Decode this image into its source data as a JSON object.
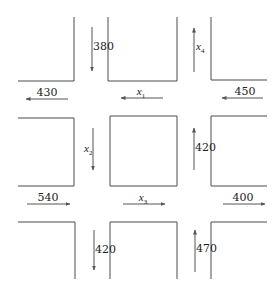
{
  "diagram": {
    "line_color": "#4a4a4a",
    "arrow_color": "#555555",
    "blocks": [
      {
        "name": "block-top-left",
        "points": "18,81 74,81 74,17"
      },
      {
        "name": "block-top-middle",
        "points": "108,17 108,81 177,81 177,17"
      },
      {
        "name": "block-top-right",
        "points": "211,17 211,80 267,80"
      },
      {
        "name": "block-middle-left",
        "points": "18,118 74,118 74,186 18,186"
      },
      {
        "name": "block-center",
        "points": "110,116 177,116 177,186 110,186 110,116"
      },
      {
        "name": "block-middle-right",
        "points": "267,116 211,116 211,186 267,186"
      },
      {
        "name": "block-bottom-left",
        "points": "18,222 75,222 75,279"
      },
      {
        "name": "block-bottom-middle",
        "points": "110,279 110,222 177,222 177,279"
      },
      {
        "name": "block-bottom-right",
        "points": "211,279 211,222 267,222"
      }
    ],
    "flows": [
      {
        "name": "flow-380-in",
        "label": "380",
        "var": false,
        "x1": 92,
        "y1": 27,
        "x2": 92,
        "y2": 71,
        "lx": 93,
        "ly": 50,
        "anchor": "start"
      },
      {
        "name": "flow-x4-out",
        "label": "x",
        "sub": "4",
        "var": true,
        "x1": 194,
        "y1": 72,
        "x2": 194,
        "y2": 28,
        "lx": 196,
        "ly": 50,
        "anchor": "start"
      },
      {
        "name": "flow-430-out",
        "label": "430",
        "var": false,
        "x1": 68,
        "y1": 99,
        "x2": 26,
        "y2": 99,
        "lx": 47,
        "ly": 96,
        "anchor": "middle"
      },
      {
        "name": "flow-x1",
        "label": "x",
        "sub": "1",
        "var": true,
        "x1": 163,
        "y1": 98,
        "x2": 121,
        "y2": 98,
        "lx": 141,
        "ly": 95,
        "anchor": "middle"
      },
      {
        "name": "flow-450-in",
        "label": "450",
        "var": false,
        "x1": 263,
        "y1": 98,
        "x2": 222,
        "y2": 98,
        "lx": 245,
        "ly": 95,
        "anchor": "middle"
      },
      {
        "name": "flow-x2",
        "label": "x",
        "sub": "2",
        "var": true,
        "x1": 93,
        "y1": 128,
        "x2": 93,
        "y2": 170,
        "lx": 84,
        "ly": 152,
        "anchor": "start"
      },
      {
        "name": "flow-420-middle-in",
        "label": "420",
        "var": false,
        "x1": 194,
        "y1": 170,
        "x2": 194,
        "y2": 128,
        "lx": 195,
        "ly": 151,
        "anchor": "start"
      },
      {
        "name": "flow-540-in",
        "label": "540",
        "var": false,
        "x1": 27,
        "y1": 204,
        "x2": 70,
        "y2": 204,
        "lx": 48,
        "ly": 201,
        "anchor": "middle"
      },
      {
        "name": "flow-x3",
        "label": "x",
        "sub": "3",
        "var": true,
        "x1": 123,
        "y1": 204,
        "x2": 165,
        "y2": 204,
        "lx": 143,
        "ly": 201,
        "anchor": "middle"
      },
      {
        "name": "flow-400-out",
        "label": "400",
        "var": false,
        "x1": 223,
        "y1": 204,
        "x2": 265,
        "y2": 204,
        "lx": 243,
        "ly": 201,
        "anchor": "middle"
      },
      {
        "name": "flow-420-bottom-out",
        "label": "420",
        "var": false,
        "x1": 94,
        "y1": 230,
        "x2": 94,
        "y2": 270,
        "lx": 95,
        "ly": 253,
        "anchor": "start"
      },
      {
        "name": "flow-470-in",
        "label": "470",
        "var": false,
        "x1": 195,
        "y1": 272,
        "x2": 195,
        "y2": 230,
        "lx": 196,
        "ly": 252,
        "anchor": "start"
      }
    ]
  }
}
